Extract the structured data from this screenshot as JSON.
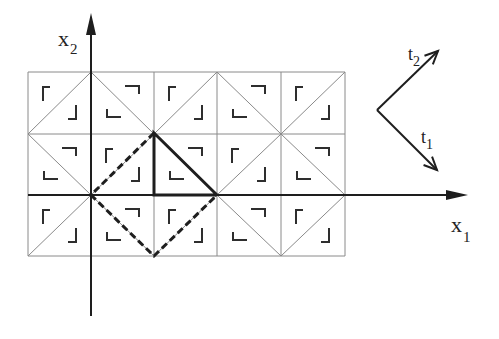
{
  "diagram": {
    "type": "triangulated-lattice",
    "colors": {
      "grid": "#8a8a8a",
      "ink": "#1e1e1e",
      "bracket": "#2e2e2e",
      "background": "#ffffff"
    },
    "grid": {
      "x_lines": [
        28,
        91,
        154,
        217,
        281,
        345
      ],
      "y_lines": [
        72,
        134,
        195,
        256
      ],
      "cells": [
        [
          "/",
          "\\",
          "/",
          "\\",
          "/"
        ],
        [
          "\\",
          "/",
          "\\",
          "/",
          "\\"
        ],
        [
          "/",
          "\\",
          "/",
          "\\",
          "/"
        ]
      ]
    },
    "axes": {
      "x1": {
        "label": "x",
        "subscript": "1",
        "from": [
          28,
          195
        ],
        "to": [
          468,
          195
        ]
      },
      "x2": {
        "label": "x",
        "subscript": "2",
        "from": [
          91,
          316
        ],
        "to": [
          91,
          13
        ]
      }
    },
    "vectors": {
      "origin": [
        377,
        110
      ],
      "t1": {
        "label": "t",
        "subscript": "1",
        "tip": [
          437,
          170
        ]
      },
      "t2": {
        "label": "t",
        "subscript": "2",
        "tip": [
          438,
          51
        ]
      }
    },
    "thick_triangle": [
      [
        154,
        133
      ],
      [
        154,
        195
      ],
      [
        217,
        195
      ]
    ],
    "dashed_path": [
      [
        154,
        133
      ],
      [
        91,
        195
      ],
      [
        154,
        256
      ],
      [
        217,
        195
      ]
    ]
  }
}
